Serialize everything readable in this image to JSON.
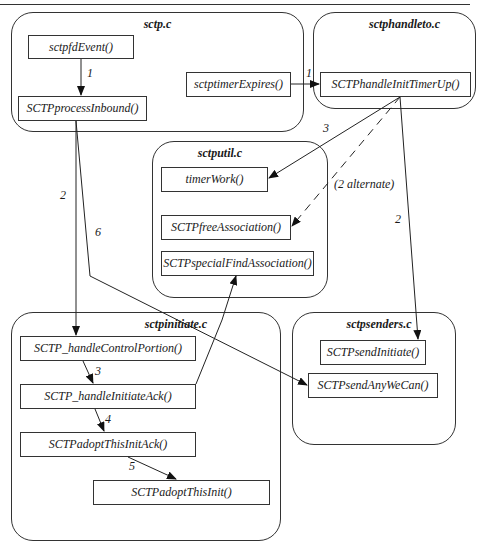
{
  "groups": {
    "sctp": {
      "title": "sctp.c"
    },
    "sctphandleto": {
      "title": "sctphandleto.c"
    },
    "sctputil": {
      "title": "sctputil.c"
    },
    "sctpinitiate": {
      "title": "sctpinitiate.c"
    },
    "sctpsenders": {
      "title": "sctpsenders.c"
    }
  },
  "functions": {
    "sctpfdEvent": "sctpfdEvent()",
    "SCTPprocessInbound": "SCTPprocessInbound()",
    "sctptimerExpires": "sctptimerExpires()",
    "SCTPhandleInitTimerUp": "SCTPhandleInitTimerUp()",
    "timerWork": "timerWork()",
    "SCTPfreeAssociation": "SCTPfreeAssociation()",
    "SCTPspecialFindAssociation": "SCTPspecialFindAssociation()",
    "SCTP_handleControlPortion": "SCTP_handleControlPortion()",
    "SCTP_handleInitiateAck": "SCTP_handleInitiateAck()",
    "SCTPadoptThisInitAck": "SCTPadoptThisInitAck()",
    "SCTPadoptThisInit": "SCTPadoptThisInit()",
    "SCTPsendInitiate": "SCTPsendInitiate()",
    "SCTPsendAnyWeCan": "SCTPsendAnyWeCan()"
  },
  "edge_labels": {
    "fdevent_to_process": "1",
    "timer_to_handleinit": "1",
    "handleinit_to_timerwork": "3",
    "handleinit_to_free": "(2 alternate)",
    "process_to_controlportion": "2",
    "process_to_sendanywecan": "6",
    "handleinit_to_sendinitiate": "2",
    "control_to_initack": "3",
    "initack_to_adoptack": "4",
    "adoptack_to_adoptinit": "5"
  },
  "edges": [
    {
      "from": "sctpfdEvent()",
      "to": "SCTPprocessInbound()",
      "label": "1",
      "style": "solid"
    },
    {
      "from": "sctptimerExpires()",
      "to": "SCTPhandleInitTimerUp()",
      "label": "1",
      "style": "solid"
    },
    {
      "from": "SCTPhandleInitTimerUp()",
      "to": "timerWork()",
      "label": "3",
      "style": "solid"
    },
    {
      "from": "SCTPhandleInitTimerUp()",
      "to": "SCTPfreeAssociation()",
      "label": "(2 alternate)",
      "style": "dashed"
    },
    {
      "from": "SCTPhandleInitTimerUp()",
      "to": "SCTPsendInitiate()",
      "label": "2",
      "style": "solid"
    },
    {
      "from": "SCTPprocessInbound()",
      "to": "SCTP_handleControlPortion()",
      "label": "2",
      "style": "solid"
    },
    {
      "from": "SCTPprocessInbound()",
      "to": "SCTPsendAnyWeCan()",
      "label": "6",
      "style": "solid"
    },
    {
      "from": "SCTP_handleControlPortion()",
      "to": "SCTP_handleInitiateAck()",
      "label": "3",
      "style": "solid"
    },
    {
      "from": "SCTP_handleInitiateAck()",
      "to": "SCTPadoptThisInitAck()",
      "label": "4",
      "style": "solid"
    },
    {
      "from": "SCTPadoptThisInitAck()",
      "to": "SCTPadoptThisInit()",
      "label": "5",
      "style": "solid"
    },
    {
      "from": "SCTP_handleInitiateAck()",
      "to": "SCTPspecialFindAssociation()",
      "label": "",
      "style": "solid"
    }
  ]
}
